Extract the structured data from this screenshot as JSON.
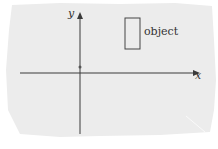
{
  "diagram": {
    "axes": {
      "x_label": "x",
      "y_label": "y"
    },
    "object_label": "object",
    "colors": {
      "paper": "#ededed",
      "ink": "#3a3a3a",
      "background": "#ffffff"
    }
  }
}
